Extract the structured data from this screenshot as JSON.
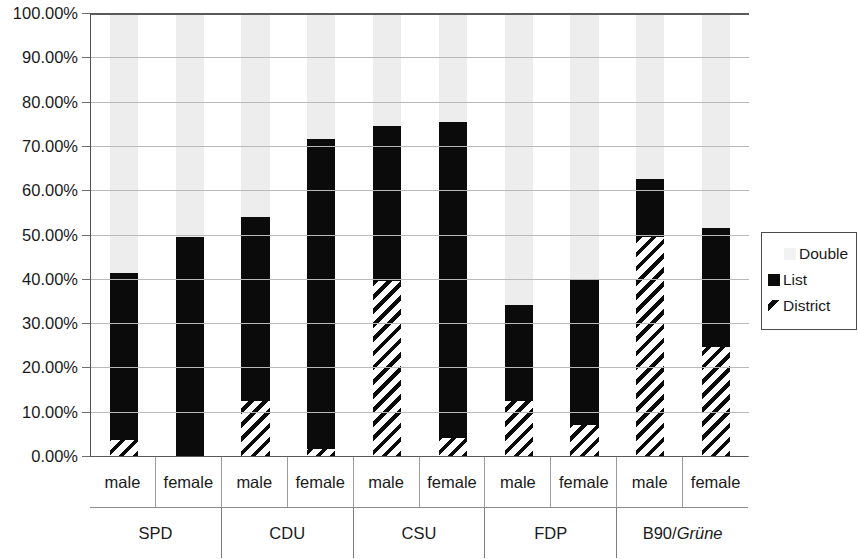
{
  "chart_data": {
    "type": "bar",
    "subtype": "stacked-percent",
    "title": "",
    "xlabel": "",
    "ylabel": "",
    "ylim": [
      0,
      100
    ],
    "yunit": "%",
    "grid": true,
    "legend_position": "right",
    "y_ticks": [
      "0.00%",
      "10.00%",
      "20.00%",
      "30.00%",
      "40.00%",
      "50.00%",
      "60.00%",
      "70.00%",
      "80.00%",
      "90.00%",
      "100.00%"
    ],
    "y_tick_values": [
      0,
      10,
      20,
      30,
      40,
      50,
      60,
      70,
      80,
      90,
      100
    ],
    "groups": [
      "SPD",
      "CDU",
      "CSU",
      "FDP",
      "B90/Grüne"
    ],
    "group_italic_parts": [
      "",
      "",
      "",
      "",
      "Grüne"
    ],
    "categories": [
      "male",
      "female",
      "male",
      "female",
      "male",
      "female",
      "male",
      "female",
      "male",
      "female"
    ],
    "series": [
      {
        "name": "District",
        "pattern": "diagonal-hatch",
        "color": "#0b0b0b",
        "values": [
          3.5,
          0.0,
          12.5,
          1.5,
          39.5,
          4.0,
          12.5,
          7.0,
          49.5,
          24.5
        ]
      },
      {
        "name": "List",
        "pattern": "solid",
        "color": "#0b0b0b",
        "values": [
          37.8,
          49.5,
          41.5,
          70.0,
          35.0,
          71.5,
          21.5,
          33.0,
          13.0,
          27.0
        ]
      },
      {
        "name": "Double",
        "pattern": "light-fill",
        "color": "#ededed",
        "values": [
          58.7,
          50.5,
          46.0,
          28.5,
          25.5,
          24.5,
          66.0,
          60.0,
          37.5,
          48.5
        ]
      }
    ],
    "cumulative_tops": {
      "district": [
        3.5,
        0.0,
        12.5,
        1.5,
        39.5,
        4.0,
        12.5,
        7.0,
        49.5,
        24.5
      ],
      "list": [
        41.3,
        49.5,
        54.0,
        71.5,
        74.5,
        75.5,
        34.0,
        40.0,
        62.5,
        51.5
      ],
      "double": [
        100,
        100,
        100,
        100,
        100,
        100,
        100,
        100,
        100,
        100
      ]
    }
  },
  "legend": {
    "items": [
      {
        "label": "Double",
        "swatch": "light-fill"
      },
      {
        "label": "List",
        "swatch": "solid-black"
      },
      {
        "label": "District",
        "swatch": "diagonal-hatch"
      }
    ]
  }
}
